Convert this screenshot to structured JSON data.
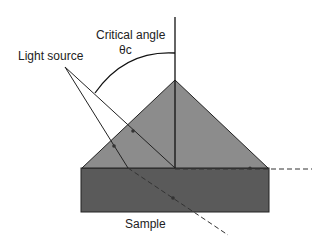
{
  "diagram": {
    "labels": {
      "critical_angle": "Critical angle",
      "theta": "θc",
      "light_source": "Light source",
      "sample": "Sample"
    },
    "colors": {
      "prism": "#8c8c8c",
      "sample": "#5a5a5a",
      "line": "#1a1a1a"
    }
  }
}
